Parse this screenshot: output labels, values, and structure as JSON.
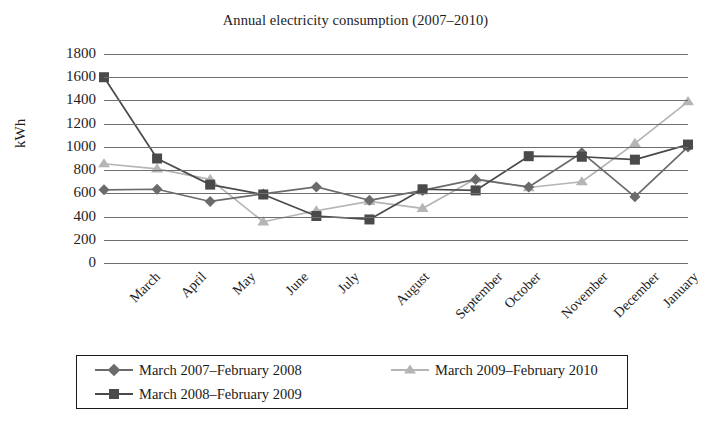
{
  "chart_data": {
    "type": "line",
    "title": "Annual electricity consumption (2007–2010)",
    "xlabel": "",
    "ylabel": "kWh",
    "ylim": [
      0,
      1800
    ],
    "ytick_step": 200,
    "grid": "horizontal",
    "legend_position": "bottom",
    "categories": [
      "March",
      "April",
      "May",
      "June",
      "July",
      "August",
      "September",
      "October",
      "November",
      "December",
      "January",
      "February"
    ],
    "ytick_labels": [
      "1800",
      "1600",
      "1400",
      "1200",
      "1000",
      "800",
      "600",
      "400",
      "200",
      "0"
    ],
    "series": [
      {
        "name": "March 2007–February 2008",
        "marker": "diamond",
        "color": "#6b6b6b",
        "values": [
          630,
          635,
          530,
          595,
          655,
          540,
          625,
          720,
          655,
          950,
          570,
          1000
        ]
      },
      {
        "name": "March 2008–February 2009",
        "marker": "square",
        "color": "#4a4a4a",
        "values": [
          1600,
          900,
          675,
          590,
          405,
          375,
          635,
          625,
          920,
          915,
          890,
          1020
        ]
      },
      {
        "name": "March 2009–February 2010",
        "marker": "triangle",
        "color": "#b5b5b5",
        "values": [
          855,
          810,
          720,
          355,
          450,
          530,
          470,
          725,
          650,
          700,
          1030,
          1390
        ]
      }
    ]
  },
  "legend": {
    "items": [
      {
        "label": "March 2007–February 2008"
      },
      {
        "label": "March 2008–February 2009"
      },
      {
        "label": "March 2009–February 2010"
      }
    ]
  }
}
